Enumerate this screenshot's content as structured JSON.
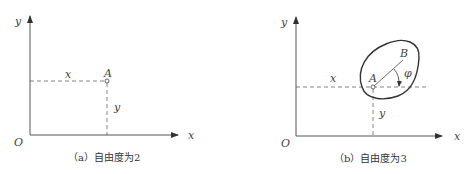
{
  "figures": [
    {
      "id": "a",
      "caption": "（a）自由度为2",
      "labels": {
        "y_axis": "y",
        "x_axis": "x",
        "origin": "O",
        "point": "A",
        "x_coord": "x",
        "y_coord": "y"
      }
    },
    {
      "id": "b",
      "caption": "（b）自由度为3",
      "labels": {
        "y_axis": "y",
        "x_axis": "x",
        "origin": "O",
        "point_a": "A",
        "point_b": "B",
        "angle": "φ",
        "x_coord": "x",
        "y_coord": "y"
      }
    }
  ],
  "colors": {
    "line": "#555555",
    "dash": "#666666",
    "text": "#444444"
  }
}
